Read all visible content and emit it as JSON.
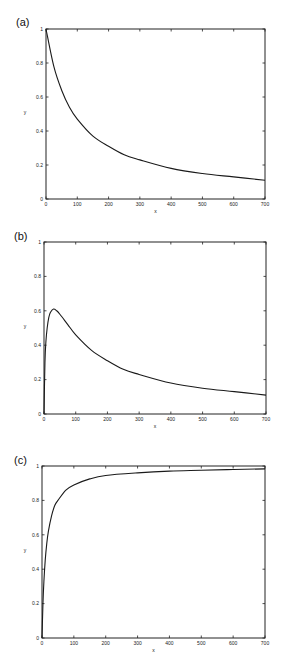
{
  "chart_data": [
    {
      "panel": "(a)",
      "type": "line",
      "title": "",
      "xlabel": "x",
      "ylabel": "y",
      "xlim": [
        0,
        700
      ],
      "ylim": [
        0,
        1
      ],
      "xticks": [
        0,
        100,
        200,
        300,
        400,
        500,
        600,
        700
      ],
      "yticks": [
        0,
        0.2,
        0.4,
        0.6,
        0.8,
        1
      ],
      "ytick_labels": [
        "0",
        "0.2",
        "0.4",
        "0.6",
        "0.8",
        "1"
      ],
      "grid": false,
      "legend": null,
      "series": [
        {
          "name": "y",
          "x": [
            0,
            25,
            50,
            75,
            100,
            150,
            200,
            250,
            300,
            400,
            500,
            600,
            700
          ],
          "y": [
            1.0,
            0.78,
            0.64,
            0.54,
            0.47,
            0.37,
            0.31,
            0.26,
            0.23,
            0.18,
            0.15,
            0.13,
            0.11
          ]
        }
      ]
    },
    {
      "panel": "(b)",
      "type": "line",
      "title": "",
      "xlabel": "x",
      "ylabel": "y",
      "xlim": [
        0,
        700
      ],
      "ylim": [
        0,
        1
      ],
      "xticks": [
        0,
        100,
        200,
        300,
        400,
        500,
        600,
        700
      ],
      "yticks": [
        0,
        0.2,
        0.4,
        0.6,
        0.8,
        1
      ],
      "ytick_labels": [
        "0",
        "0.2",
        "0.4",
        "0.6",
        "0.8",
        "1"
      ],
      "grid": false,
      "legend": null,
      "series": [
        {
          "name": "y",
          "x": [
            0,
            3,
            6,
            10,
            15,
            20,
            30,
            40,
            50,
            75,
            100,
            150,
            200,
            250,
            300,
            400,
            500,
            600,
            700
          ],
          "y": [
            0.0,
            0.3,
            0.42,
            0.5,
            0.56,
            0.59,
            0.61,
            0.6,
            0.58,
            0.52,
            0.46,
            0.37,
            0.31,
            0.26,
            0.23,
            0.18,
            0.15,
            0.13,
            0.11
          ]
        }
      ]
    },
    {
      "panel": "(c)",
      "type": "line",
      "title": "",
      "xlabel": "x",
      "ylabel": "y",
      "xlim": [
        0,
        700
      ],
      "ylim": [
        0,
        1
      ],
      "xticks": [
        0,
        100,
        200,
        300,
        400,
        500,
        600,
        700
      ],
      "yticks": [
        0,
        0.2,
        0.4,
        0.6,
        0.8,
        1
      ],
      "ytick_labels": [
        "0",
        "0.2",
        "0.4",
        "0.6",
        "0.8",
        "1"
      ],
      "grid": false,
      "legend": null,
      "series": [
        {
          "name": "y",
          "x": [
            0,
            3,
            6,
            10,
            15,
            20,
            30,
            40,
            50,
            75,
            100,
            150,
            200,
            300,
            400,
            500,
            600,
            700
          ],
          "y": [
            0.0,
            0.2,
            0.33,
            0.45,
            0.55,
            0.62,
            0.71,
            0.77,
            0.8,
            0.86,
            0.89,
            0.925,
            0.945,
            0.96,
            0.97,
            0.975,
            0.98,
            0.983
          ]
        }
      ]
    }
  ],
  "panels": [
    {
      "label": "(a)"
    },
    {
      "label": "(b)"
    },
    {
      "label": "(c)"
    }
  ]
}
